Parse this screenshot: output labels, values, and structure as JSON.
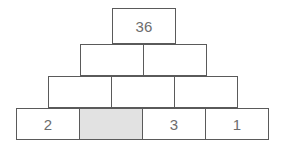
{
  "diagram": {
    "type": "number-pyramid",
    "geometry": {
      "cell_width": 64,
      "cell_height": 32,
      "rows": [
        {
          "top": 8,
          "left": 112,
          "height": 36
        },
        {
          "top": 44,
          "left": 80,
          "height": 32
        },
        {
          "top": 76,
          "left": 48,
          "height": 32
        },
        {
          "top": 108,
          "left": 16,
          "height": 32
        }
      ]
    },
    "colors": {
      "border": "#5a5a5a",
      "text": "#6d6d6d",
      "background": "#ffffff",
      "shaded_cell": "#e2e2e2"
    },
    "rows": [
      {
        "index": 0,
        "cells": [
          {
            "value": "36",
            "empty": false,
            "shaded": false
          }
        ]
      },
      {
        "index": 1,
        "cells": [
          {
            "value": "",
            "empty": true,
            "shaded": false
          },
          {
            "value": "",
            "empty": true,
            "shaded": false
          }
        ]
      },
      {
        "index": 2,
        "cells": [
          {
            "value": "",
            "empty": true,
            "shaded": false
          },
          {
            "value": "",
            "empty": true,
            "shaded": false
          },
          {
            "value": "",
            "empty": true,
            "shaded": false
          }
        ]
      },
      {
        "index": 3,
        "cells": [
          {
            "value": "2",
            "empty": false,
            "shaded": false
          },
          {
            "value": "",
            "empty": true,
            "shaded": true
          },
          {
            "value": "3",
            "empty": false,
            "shaded": false
          },
          {
            "value": "1",
            "empty": false,
            "shaded": false
          }
        ]
      }
    ]
  }
}
